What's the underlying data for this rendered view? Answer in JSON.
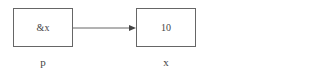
{
  "diagram": {
    "nodes": [
      {
        "id": "p",
        "content": "&x",
        "label": "p"
      },
      {
        "id": "x",
        "content": "10",
        "label": "x"
      }
    ],
    "edges": [
      {
        "from": "p",
        "to": "x",
        "type": "arrow"
      }
    ],
    "colors": {
      "stroke": "#666666",
      "text": "#444444"
    }
  }
}
